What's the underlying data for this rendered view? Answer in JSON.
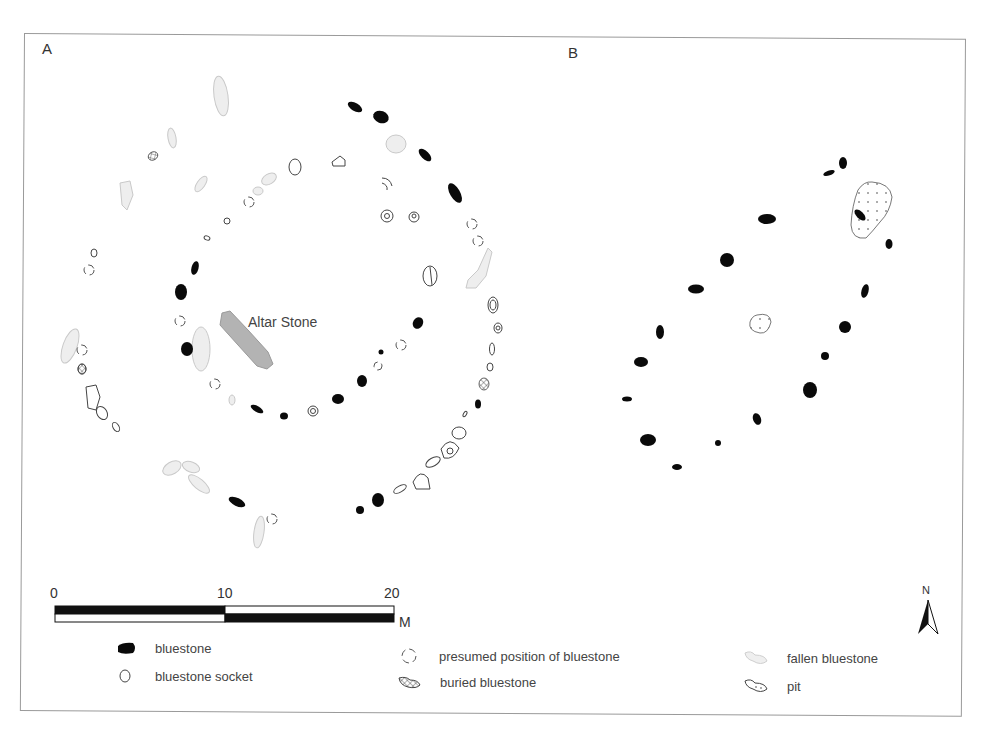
{
  "panels": {
    "a_label": "A",
    "b_label": "B"
  },
  "annotations": {
    "altar_stone": "Altar Stone"
  },
  "scale_bar": {
    "ticks": [
      "0",
      "10",
      "20"
    ],
    "unit": "M"
  },
  "north_arrow": {
    "label": "N"
  },
  "legend": {
    "items": [
      {
        "symbol": "bluestone-icon",
        "label": "bluestone"
      },
      {
        "symbol": "bluestone-socket-icon",
        "label": "bluestone socket"
      },
      {
        "symbol": "presumed-position-icon",
        "label": "presumed position of bluestone"
      },
      {
        "symbol": "buried-bluestone-icon",
        "label": "buried bluestone"
      },
      {
        "symbol": "fallen-bluestone-icon",
        "label": "fallen bluestone"
      },
      {
        "symbol": "pit-icon",
        "label": "pit"
      }
    ]
  },
  "colors": {
    "bluestone": "#0a0a0a",
    "fallen": "#ececec",
    "fallen_stroke": "#c8c8c8",
    "altar": "#b0b0b0",
    "outline": "#444444"
  }
}
